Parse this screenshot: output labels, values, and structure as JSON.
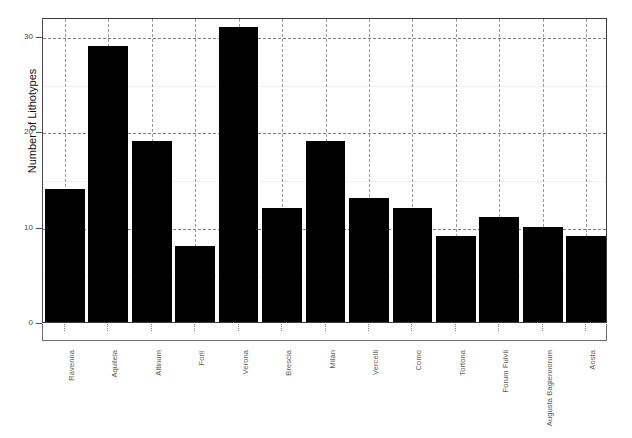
{
  "chart_data": {
    "type": "bar",
    "title": "",
    "subtitle": "",
    "xlabel": "",
    "ylabel": "Number of Lithotypes",
    "categories": [
      "Ravenna",
      "Aquileia",
      "Altinum",
      "Forlì",
      "Verona",
      "Brescia",
      "Milan",
      "Vercelli",
      "Como",
      "Tortona",
      "Forum Fulvii",
      "Augusta Bagiennorum",
      "Aosta"
    ],
    "values": [
      14,
      29,
      19,
      8,
      31,
      12,
      19,
      13,
      12,
      9,
      11,
      10,
      9
    ],
    "ylim": [
      0,
      32
    ],
    "yticks": [
      0,
      10,
      20,
      30
    ],
    "ytick_labels": [
      "0",
      "10",
      "20",
      "30"
    ],
    "yminor_ticks": [
      5,
      15,
      25
    ],
    "grid": "both",
    "grid_style": "dashed",
    "legend": "none",
    "bar_color": "#000000",
    "grid_color": "#9a9a9a",
    "axis_color": "#3a3a3a",
    "background": "#ffffff"
  }
}
